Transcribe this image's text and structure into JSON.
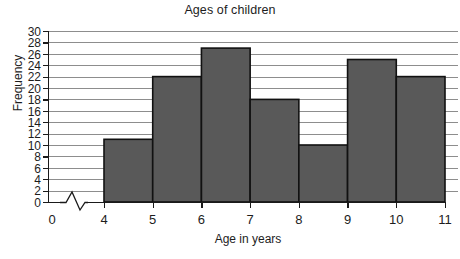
{
  "chart_data": {
    "type": "bar",
    "title": "Ages of children",
    "xlabel": "Age in years",
    "ylabel": "Frequency",
    "subtitle": "",
    "categories": [
      "4-5",
      "5-6",
      "6-7",
      "7-8",
      "8-9",
      "9-10",
      "10-11"
    ],
    "bin_edges": [
      4,
      5,
      6,
      7,
      8,
      9,
      10,
      11
    ],
    "values": [
      11,
      22,
      27,
      18,
      10,
      25,
      22
    ],
    "x_tick_labels": [
      "0",
      "4",
      "5",
      "6",
      "7",
      "8",
      "9",
      "10",
      "11"
    ],
    "y_tick_labels": [
      "0",
      "2",
      "4",
      "6",
      "8",
      "10",
      "12",
      "14",
      "16",
      "18",
      "20",
      "22",
      "24",
      "26",
      "28",
      "30"
    ],
    "y_ticks": [
      0,
      2,
      4,
      6,
      8,
      10,
      12,
      14,
      16,
      18,
      20,
      22,
      24,
      26,
      28,
      30
    ],
    "ylim": [
      0,
      30
    ],
    "xlim": [
      4,
      11
    ],
    "grid": true,
    "legend": false,
    "legend_position": "none",
    "axis_break": true,
    "axis_break_note": "zigzag break on x-axis between 0 and 4",
    "bar_fill_color": "#595959",
    "bar_border_color": "#111111",
    "gridline_color": "#8d8d8d",
    "axis_color": "#1a1a1a",
    "background_color": "#ffffff"
  }
}
